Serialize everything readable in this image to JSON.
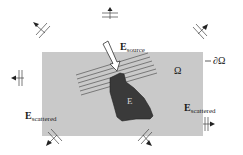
{
  "diagram": {
    "domain_label": "Ω",
    "boundary_label": "∂Ω",
    "object_label": "E",
    "source_label": {
      "main": "E",
      "sub": "source"
    },
    "scattered_left": {
      "main": "E",
      "sub": "scattered"
    },
    "scattered_right": {
      "main": "E",
      "sub": "scattered"
    },
    "colors": {
      "domain_fill": "#c9c9c9",
      "object_fill": "#3a3a3a",
      "wavefront_lines": "#555555",
      "arrow_fill": "#ffffff",
      "text": "#1a1a1a"
    },
    "outgoing_wave_markers": [
      {
        "name": "top",
        "direction": "up"
      },
      {
        "name": "top-left",
        "direction": "up-left"
      },
      {
        "name": "top-right",
        "direction": "up-right"
      },
      {
        "name": "left",
        "direction": "left"
      },
      {
        "name": "right",
        "direction": "right"
      },
      {
        "name": "bottom-left",
        "direction": "down-left"
      },
      {
        "name": "bottom-center",
        "direction": "down-right"
      }
    ]
  }
}
